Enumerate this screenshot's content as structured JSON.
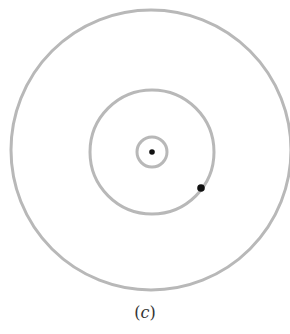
{
  "diagram": {
    "center": {
      "x": 152,
      "y": 152
    },
    "rings": [
      {
        "name": "inner-ring",
        "r": 15
      },
      {
        "name": "middle-ring",
        "r": 63
      },
      {
        "name": "outer-ring",
        "r": 140
      }
    ],
    "ring_color": "#b8b8b8",
    "dots": [
      {
        "name": "center-dot",
        "x": 152,
        "y": 152,
        "r": 3
      },
      {
        "name": "orbit-dot",
        "x": 201,
        "y": 188,
        "r": 4
      }
    ],
    "dot_color": "#111111"
  },
  "caption": {
    "open": "(",
    "letter": "c",
    "close": ")"
  }
}
